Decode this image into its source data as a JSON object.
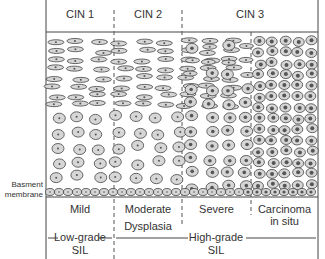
{
  "header": {
    "columns": [
      {
        "label": "CIN 1"
      },
      {
        "label": "CIN 2"
      },
      {
        "label": "CIN 3"
      }
    ]
  },
  "side_label": {
    "line1": "Basment",
    "line2": "membrane"
  },
  "grades": [
    {
      "label": "Mild"
    },
    {
      "label": "Moderate"
    },
    {
      "label": "Severe"
    },
    {
      "label_line1": "Carcinoma",
      "label_line2": "in situ"
    }
  ],
  "dysplasia_label": "Dysplasia",
  "sil": {
    "low": {
      "line1": "Low-grade",
      "line2": "SIL"
    },
    "high": {
      "line1": "High-grade",
      "line2": "SIL"
    }
  },
  "colors": {
    "line": "#444444",
    "cell_fill": "#d6d6d6",
    "nucleus": "#555555"
  }
}
